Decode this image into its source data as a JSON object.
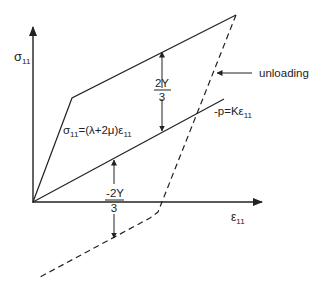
{
  "diagram": {
    "axes": {
      "y_label": "σ",
      "y_sub": "11",
      "x_label": "ε",
      "x_sub": "11"
    },
    "labels": {
      "elastic_eq": "σ",
      "elastic_eq_sub1": "11",
      "elastic_eq_mid": "=(λ+2μ)ε",
      "elastic_eq_sub2": "11",
      "hydro_eq": "-p=Kε",
      "hydro_eq_sub": "11",
      "unloading": "unloading",
      "upper_frac_num": "2Y",
      "upper_frac_den": "3",
      "lower_frac_num": "-2Y",
      "lower_frac_den": "3"
    },
    "colors": {
      "line": "#222222",
      "background": "#ffffff"
    }
  }
}
